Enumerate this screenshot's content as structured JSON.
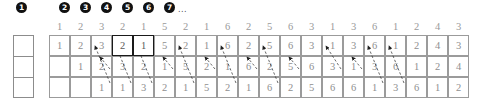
{
  "diagram": {
    "title_bullets": {
      "labels": [
        "1",
        "2",
        "3",
        "4",
        "5",
        "6",
        "7"
      ],
      "ellipsis": "...",
      "x_positions": [
        16,
        59,
        80,
        101,
        122,
        143,
        164
      ],
      "ellipsis_x": 178
    },
    "header_row": {
      "values": [
        "1",
        "2",
        "3",
        "2",
        "1",
        "5",
        "2",
        "1",
        "6",
        "2",
        "5",
        "6",
        "3",
        "1",
        "3",
        "6",
        "1",
        "2",
        "4",
        "3"
      ],
      "start_x": 49,
      "step": 21
    },
    "left_empty_column": {
      "rows": [
        "",
        "",
        ""
      ]
    },
    "grid": {
      "columns": 20,
      "rows": 3,
      "start_x": 49,
      "start_y": 35,
      "cell_w": 21,
      "cell_h": 21,
      "row_offsets": [
        0,
        1,
        2
      ],
      "row1": [
        "1",
        "2",
        "3",
        "2",
        "1",
        "5",
        "2",
        "1",
        "6",
        "2",
        "5",
        "6",
        "3",
        "1",
        "3",
        "6",
        "1",
        "2",
        "4",
        "3"
      ],
      "row2": [
        "1",
        "2",
        "3",
        "2",
        "1",
        "5",
        "2",
        "1",
        "6",
        "2",
        "5",
        "6",
        "3",
        "1",
        "3",
        "6",
        "1",
        "2",
        "4"
      ],
      "row3": [
        "1",
        "1",
        "3",
        "2",
        "1",
        "5",
        "2",
        "1",
        "6",
        "2",
        "5",
        "6",
        "6",
        "1",
        "3",
        "6",
        "1",
        "2"
      ],
      "bold_cells": [
        {
          "row": 0,
          "col": 3
        },
        {
          "row": 0,
          "col": 4
        }
      ]
    },
    "arrows": {
      "description": "diagonal up-left pointers from lower rows to upper-left cells",
      "items": [
        {
          "x1": 110,
          "y1": 83,
          "x2": 95,
          "y2": 46
        },
        {
          "x1": 131,
          "y1": 83,
          "x2": 116,
          "y2": 46
        },
        {
          "x1": 152,
          "y1": 83,
          "x2": 137,
          "y2": 46
        },
        {
          "x1": 194,
          "y1": 83,
          "x2": 179,
          "y2": 46
        },
        {
          "x1": 236,
          "y1": 83,
          "x2": 221,
          "y2": 46
        },
        {
          "x1": 278,
          "y1": 83,
          "x2": 263,
          "y2": 46
        },
        {
          "x1": 341,
          "y1": 69,
          "x2": 326,
          "y2": 46
        },
        {
          "x1": 383,
          "y1": 83,
          "x2": 368,
          "y2": 46
        },
        {
          "x1": 404,
          "y1": 83,
          "x2": 389,
          "y2": 46
        },
        {
          "x1": 110,
          "y1": 69,
          "x2": 100,
          "y2": 57
        },
        {
          "x1": 173,
          "y1": 69,
          "x2": 163,
          "y2": 57
        },
        {
          "x1": 215,
          "y1": 69,
          "x2": 205,
          "y2": 57
        },
        {
          "x1": 257,
          "y1": 69,
          "x2": 247,
          "y2": 57
        },
        {
          "x1": 299,
          "y1": 69,
          "x2": 289,
          "y2": 57
        },
        {
          "x1": 362,
          "y1": 69,
          "x2": 352,
          "y2": 57
        }
      ]
    },
    "colors": {
      "cell_border": "#9b9b9b",
      "bold_border": "#1a1a1a",
      "text": "#8f8f8f",
      "bullet_bg": "#111111",
      "bullet_text": "#ffffff",
      "background": "#ffffff"
    }
  }
}
